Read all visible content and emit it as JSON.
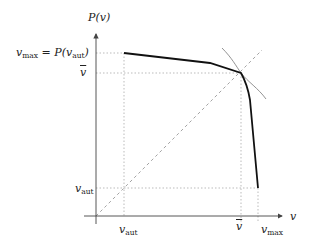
{
  "diagram": {
    "y_axis_label": "P(v)",
    "x_axis_label": "v",
    "labels": {
      "vmax_eq_left": "v",
      "vmax_eq_sub": "max",
      "vmax_eq_mid": " = P(v",
      "vmax_eq_sub2": "aut",
      "vmax_eq_right": ")",
      "vbar_y": "v",
      "vaut_y": "v",
      "vaut_y_sub": "aut",
      "vaut_x": "v",
      "vaut_x_sub": "aut",
      "vbar_x": "v",
      "vmax_x": "v",
      "vmax_x_sub": "max"
    },
    "colors": {
      "curve": "#111111",
      "thin_curve": "#777777",
      "axis": "#444444",
      "guide": "#aaaaaa"
    },
    "points": {
      "origin": [
        96,
        216
      ],
      "v_aut": 124,
      "v_bar": 241,
      "v_max": 258,
      "y_vmax": 53,
      "y_vbar": 73,
      "y_vaut": 188
    },
    "curve_points": [
      [
        124,
        53
      ],
      [
        210,
        63
      ],
      [
        241,
        73
      ],
      [
        248,
        92
      ],
      [
        258,
        188
      ]
    ]
  }
}
